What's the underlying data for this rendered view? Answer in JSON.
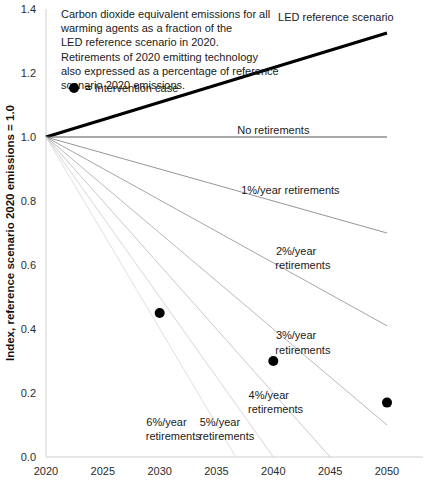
{
  "chart_data": {
    "type": "line",
    "title": "",
    "xlabel": "",
    "ylabel": "Index, reference scenario 2020 emissions = 1.0",
    "xlim": [
      2020,
      2050
    ],
    "ylim": [
      0.0,
      1.4
    ],
    "xticks": [
      2020,
      2025,
      2030,
      2035,
      2040,
      2045,
      2050
    ],
    "xtick_labels": [
      "2020",
      "2025",
      "2030",
      "2035",
      "2040",
      "2045",
      "2050"
    ],
    "yticks": [
      0.0,
      0.2,
      0.4,
      0.6,
      0.8,
      1.0,
      1.2,
      1.4
    ],
    "ytick_labels": [
      "0.0",
      "0.2",
      "0.4",
      "0.6",
      "0.8",
      "1.0",
      "1.2",
      "1.4"
    ],
    "grid": false,
    "legend_position": "inline-annotations",
    "series": [
      {
        "name": "LED reference scenario",
        "color": "#000000",
        "width": 3.2,
        "x": [
          2020,
          2050
        ],
        "values": [
          1.0,
          1.325
        ]
      },
      {
        "name": "No retirements",
        "color": "#555555",
        "width": 1.0,
        "x": [
          2020,
          2050
        ],
        "values": [
          1.0,
          1.0
        ]
      },
      {
        "name": "1%/year retirements",
        "color": "#8a8a8a",
        "width": 0.9,
        "x": [
          2020,
          2050
        ],
        "values": [
          1.0,
          0.7
        ]
      },
      {
        "name": "2%/year retirements",
        "color": "#9a9a9a",
        "width": 0.9,
        "x": [
          2020,
          2050
        ],
        "values": [
          1.0,
          0.41
        ]
      },
      {
        "name": "3%/year retirements",
        "color": "#b0b0b0",
        "width": 0.9,
        "x": [
          2020,
          2050
        ],
        "values": [
          1.0,
          0.1
        ]
      },
      {
        "name": "4%/year retirements",
        "color": "#c2c2c2",
        "width": 0.9,
        "x": [
          2020,
          2045
        ],
        "values": [
          1.0,
          0.0
        ]
      },
      {
        "name": "5%/year retirements",
        "color": "#d2d2d2",
        "width": 0.9,
        "x": [
          2020,
          2040
        ],
        "values": [
          1.0,
          0.0
        ]
      },
      {
        "name": "6%/year retirements",
        "color": "#dcdcdc",
        "width": 0.9,
        "x": [
          2020,
          2036.7
        ],
        "values": [
          1.0,
          0.0
        ]
      }
    ],
    "scatter": {
      "name": "Intervention case",
      "color": "#000000",
      "x": [
        2030,
        2040,
        2050
      ],
      "values": [
        0.45,
        0.3,
        0.17
      ]
    },
    "annotations": [
      {
        "id": "led",
        "text": "LED reference scenario",
        "x": 2045.5,
        "y": 1.375,
        "anchor": "middle"
      },
      {
        "id": "no-ret",
        "text": "No retirements",
        "x": 2040.0,
        "y": 1.022,
        "anchor": "middle"
      },
      {
        "id": "r1",
        "text": "1%/year retirements",
        "x": 2041.5,
        "y": 0.835,
        "anchor": "middle"
      },
      {
        "id": "r2a",
        "text": "2%/year",
        "x": 2042.0,
        "y": 0.645,
        "anchor": "middle"
      },
      {
        "id": "r2b",
        "text": "retirements",
        "x": 2042.6,
        "y": 0.6,
        "anchor": "middle"
      },
      {
        "id": "r3a",
        "text": "3%/year",
        "x": 2042.0,
        "y": 0.38,
        "anchor": "middle"
      },
      {
        "id": "r3b",
        "text": "retirements",
        "x": 2042.6,
        "y": 0.335,
        "anchor": "middle"
      },
      {
        "id": "r4a",
        "text": "4%/year",
        "x": 2039.6,
        "y": 0.195,
        "anchor": "middle"
      },
      {
        "id": "r4b",
        "text": "retirements",
        "x": 2040.2,
        "y": 0.15,
        "anchor": "middle"
      },
      {
        "id": "r5a",
        "text": "5%/year",
        "x": 2035.3,
        "y": 0.11,
        "anchor": "middle"
      },
      {
        "id": "r5b",
        "text": "retirements",
        "x": 2035.9,
        "y": 0.065,
        "anchor": "middle"
      },
      {
        "id": "r6a",
        "text": "6%/year",
        "x": 2030.6,
        "y": 0.11,
        "anchor": "middle"
      },
      {
        "id": "r6b",
        "text": "retirements",
        "x": 2031.2,
        "y": 0.065,
        "anchor": "middle"
      }
    ]
  },
  "note": {
    "lines": [
      "Carbon dioxide equivalent emissions for all",
      "warming agents as a fraction of the",
      "LED reference scenario in 2020.",
      "Retirements of 2020 emitting technology",
      "also expressed as a percentage of reference",
      "scenario 2020 emissions."
    ]
  },
  "legend": {
    "marker_label": "= Intervention case"
  },
  "colors": {
    "background": "#ffffff",
    "axis": "#cfcfcf",
    "text": "#1a1a1a",
    "led": "#000000",
    "marker": "#000000"
  }
}
